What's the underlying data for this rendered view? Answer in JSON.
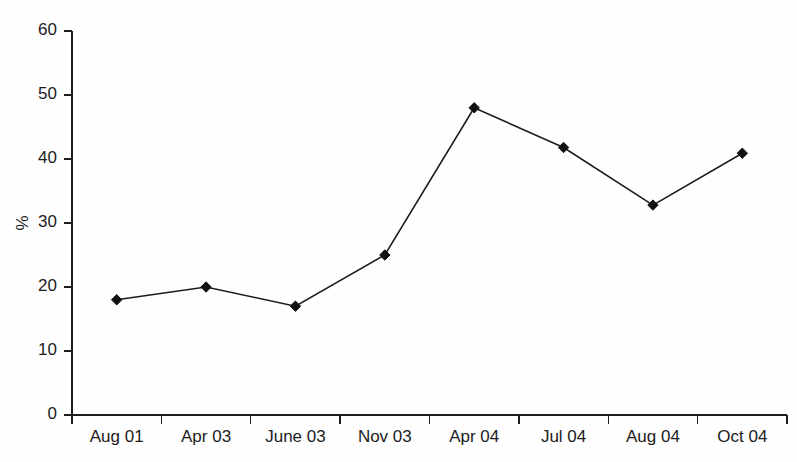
{
  "chart_data": {
    "type": "line",
    "title": "",
    "subtitle": "",
    "xlabel": "",
    "ylabel": "%",
    "categories": [
      "Aug 01",
      "Apr 03",
      "June 03",
      "Nov 03",
      "Apr 04",
      "Jul 04",
      "Aug 04",
      "Oct 04"
    ],
    "values": [
      18,
      20,
      17,
      25,
      48,
      41.8,
      32.8,
      40.9
    ],
    "series": [
      {
        "name": "",
        "values": [
          18,
          20,
          17,
          25,
          48,
          41.8,
          32.8,
          40.9
        ]
      }
    ],
    "ylim": [
      0,
      60
    ],
    "yticks": [
      0,
      10,
      20,
      30,
      40,
      50,
      60
    ],
    "ytick_labels": [
      "0",
      "10",
      "20",
      "30",
      "40",
      "50",
      "60"
    ],
    "grid": false,
    "legend": "none",
    "annotations": [],
    "marker": "diamond",
    "line_color": "#1c1c1c",
    "marker_color": "#111111",
    "background_color": "#fefefe"
  },
  "axes": {
    "y_axis_title": "%",
    "x_axis_title": ""
  }
}
